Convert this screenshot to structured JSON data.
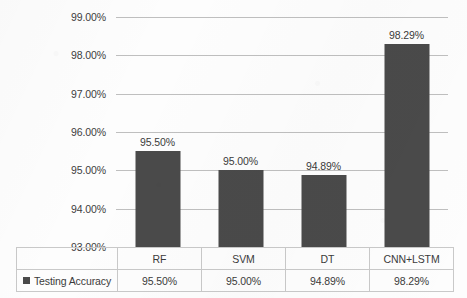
{
  "chart_data": {
    "type": "bar",
    "title": "",
    "xlabel": "",
    "ylabel": "",
    "categories": [
      "RF",
      "SVM",
      "DT",
      "CNN+LSTM"
    ],
    "values": [
      95.5,
      95.0,
      94.89,
      98.29
    ],
    "value_labels": [
      "95.50%",
      "95.00%",
      "94.89%",
      "98.29%"
    ],
    "series": [
      {
        "name": "Testing Accuracy",
        "values": [
          95.5,
          95.0,
          94.89,
          98.29
        ],
        "color": "#4a4a4a"
      }
    ],
    "ylim": [
      93.0,
      99.0
    ],
    "ytick_values": [
      93.0,
      94.0,
      95.0,
      96.0,
      97.0,
      98.0,
      99.0
    ],
    "ytick_labels": [
      "93.00%",
      "94.00%",
      "95.00%",
      "96.00%",
      "97.00%",
      "98.00%",
      "99.00%"
    ],
    "grid": true,
    "legend_position": "data-table-left",
    "has_data_table": true
  },
  "legend": {
    "series_label": "Testing Accuracy",
    "swatch_color": "#4a4a4a"
  },
  "data_table": {
    "category_row": [
      "RF",
      "SVM",
      "DT",
      "CNN+LSTM"
    ],
    "value_row": [
      "95.50%",
      "95.00%",
      "94.89%",
      "98.29%"
    ]
  },
  "colors": {
    "bar": "#4a4a4a",
    "gridline": "#bfbfbf",
    "text": "#3b3b3b",
    "table_border": "#c9c9c9",
    "background": "#fdfdfd"
  }
}
